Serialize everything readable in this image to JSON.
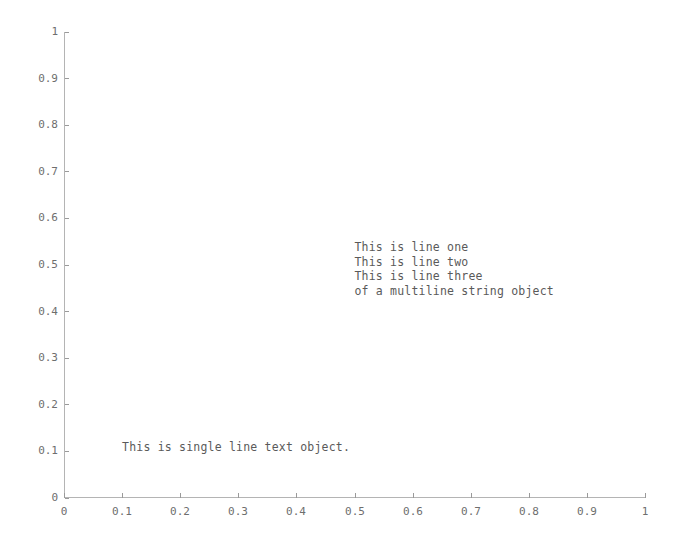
{
  "figure": {
    "background_color": "#ffffff",
    "axis_color": "#b4b4b4",
    "tick_color": "#9a9a9a",
    "tick_label_color": "#6e6e6e",
    "text_color": "#5a5a5a"
  },
  "chart_data": {
    "type": "scatter",
    "title": "",
    "xlabel": "",
    "ylabel": "",
    "xlim": [
      0,
      1
    ],
    "ylim": [
      0,
      1
    ],
    "grid": false,
    "legend": null,
    "series": [],
    "x_tick_labels": [
      "0",
      "0.1",
      "0.2",
      "0.3",
      "0.4",
      "0.5",
      "0.6",
      "0.7",
      "0.8",
      "0.9",
      "1"
    ],
    "x_tick_values": [
      0,
      0.1,
      0.2,
      0.3,
      0.4,
      0.5,
      0.6,
      0.7,
      0.8,
      0.9,
      1
    ],
    "y_tick_labels": [
      "0",
      "0.1",
      "0.2",
      "0.3",
      "0.4",
      "0.5",
      "0.6",
      "0.7",
      "0.8",
      "0.9",
      "1"
    ],
    "y_tick_values": [
      0,
      0.1,
      0.2,
      0.3,
      0.4,
      0.5,
      0.6,
      0.7,
      0.8,
      0.9,
      1
    ],
    "annotations": [
      {
        "name": "single-line-text",
        "text": "This is single line text object.",
        "x": 0.1,
        "y": 0.1
      },
      {
        "name": "multiline-text",
        "text": "This is line one\nThis is line two\nThis is line three\nof a multiline string object",
        "lines": [
          "This is line one",
          "This is line two",
          "This is line three",
          "of a multiline string object"
        ],
        "x": 0.5,
        "y": 0.53
      }
    ]
  }
}
